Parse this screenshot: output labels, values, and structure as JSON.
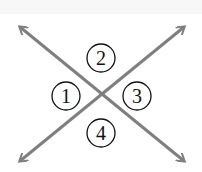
{
  "diagram": {
    "type": "intersecting-lines-angles",
    "line_color": "#7f7f7f",
    "circle_stroke": "#111111",
    "lines": [
      {
        "from": [
          18,
          163
        ],
        "to": [
          186,
          25
        ],
        "arrows": "both"
      },
      {
        "from": [
          18,
          25
        ],
        "to": [
          186,
          163
        ],
        "arrows": "both"
      }
    ],
    "angles": [
      {
        "label": "1",
        "cx": 66,
        "cy": 96
      },
      {
        "label": "2",
        "cx": 101,
        "cy": 58
      },
      {
        "label": "3",
        "cx": 137,
        "cy": 96
      },
      {
        "label": "4",
        "cx": 101,
        "cy": 133
      }
    ]
  }
}
